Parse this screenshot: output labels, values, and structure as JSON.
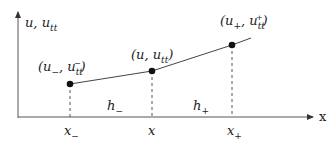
{
  "diagram": {
    "y_axis_label": "u, u_tt",
    "x_axis_label": "x",
    "points": [
      {
        "label": "(u−, u−tt)",
        "x_label": "x−"
      },
      {
        "label": "(u, utt)",
        "x_label": "x"
      },
      {
        "label": "(u+, u+tt)",
        "x_label": "x+"
      }
    ],
    "intervals": [
      "h−",
      "h+"
    ]
  }
}
